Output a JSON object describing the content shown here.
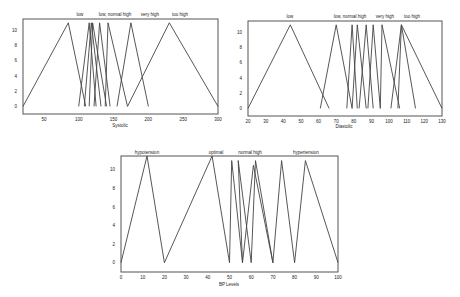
{
  "chart_data": [
    {
      "type": "line",
      "title": "",
      "xlabel": "Systolic",
      "ylabel": "",
      "xlim": [
        20,
        300
      ],
      "ylim": [
        -1,
        11.5
      ],
      "xticks": [
        50,
        100,
        150,
        200,
        250,
        300
      ],
      "yticks": [
        0,
        2,
        4,
        6,
        8,
        10
      ],
      "grid": false,
      "annotations": [
        "low",
        "low, normal high",
        "very high",
        "too high"
      ],
      "series": [
        {
          "name": "low",
          "x": [
            20,
            85,
            110
          ],
          "y": [
            0,
            11,
            0
          ]
        },
        {
          "name": "low_2",
          "x": [
            100,
            115,
            125
          ],
          "y": [
            0,
            11,
            0
          ]
        },
        {
          "name": "normal",
          "x": [
            108,
            118,
            132
          ],
          "y": [
            0,
            11,
            0
          ]
        },
        {
          "name": "normal_2",
          "x": [
            115,
            120,
            140
          ],
          "y": [
            0,
            11,
            0
          ]
        },
        {
          "name": "high",
          "x": [
            122,
            130,
            145
          ],
          "y": [
            0,
            11,
            0
          ]
        },
        {
          "name": "high_2",
          "x": [
            138,
            142,
            170
          ],
          "y": [
            0,
            11,
            0
          ]
        },
        {
          "name": "very high",
          "x": [
            155,
            175,
            200
          ],
          "y": [
            0,
            11,
            0
          ]
        },
        {
          "name": "too high",
          "x": [
            170,
            230,
            300
          ],
          "y": [
            0,
            11,
            0
          ]
        }
      ]
    },
    {
      "type": "line",
      "title": "",
      "xlabel": "Diastolic",
      "ylabel": "",
      "xlim": [
        20,
        130
      ],
      "ylim": [
        -1,
        11.5
      ],
      "xticks": [
        20,
        30,
        40,
        50,
        60,
        70,
        80,
        90,
        100,
        110,
        120,
        130
      ],
      "yticks": [
        0,
        2,
        4,
        6,
        8,
        10
      ],
      "grid": false,
      "annotations": [
        "low",
        "low, normal high",
        "very high",
        "too high"
      ],
      "series": [
        {
          "name": "low",
          "x": [
            20,
            44,
            66
          ],
          "y": [
            0,
            11,
            0
          ]
        },
        {
          "name": "low_2",
          "x": [
            61,
            70,
            79
          ],
          "y": [
            0,
            11,
            0
          ]
        },
        {
          "name": "normal",
          "x": [
            76,
            79,
            82
          ],
          "y": [
            0,
            11,
            0
          ]
        },
        {
          "name": "normal_2",
          "x": [
            79,
            82,
            87
          ],
          "y": [
            0,
            11,
            0
          ]
        },
        {
          "name": "high",
          "x": [
            83,
            87,
            91
          ],
          "y": [
            0,
            11,
            0
          ]
        },
        {
          "name": "high_2",
          "x": [
            88,
            91,
            95
          ],
          "y": [
            0,
            11,
            0
          ]
        },
        {
          "name": "very high",
          "x": [
            95,
            96,
            106
          ],
          "y": [
            0,
            11,
            0
          ]
        },
        {
          "name": "too high",
          "x": [
            105,
            107,
            130
          ],
          "y": [
            0,
            11,
            0
          ]
        },
        {
          "name": "too high_2",
          "x": [
            101,
            107,
            115
          ],
          "y": [
            0,
            11,
            0
          ]
        }
      ]
    },
    {
      "type": "line",
      "title": "",
      "xlabel": "BP Levels",
      "ylabel": "",
      "xlim": [
        0,
        100
      ],
      "ylim": [
        -1,
        11.5
      ],
      "xticks": [
        0,
        10,
        20,
        30,
        40,
        50,
        60,
        70,
        80,
        90,
        100
      ],
      "yticks": [
        0,
        2,
        4,
        6,
        8,
        10
      ],
      "grid": false,
      "annotations": [
        "hypotension",
        "optimal",
        "normal high",
        "hypertension"
      ],
      "series": [
        {
          "name": "hypotension",
          "x": [
            0,
            12,
            20
          ],
          "y": [
            0,
            11.5,
            0
          ]
        },
        {
          "name": "optimal",
          "x": [
            20,
            42,
            50
          ],
          "y": [
            0,
            11.5,
            0
          ]
        },
        {
          "name": "normal",
          "x": [
            50,
            51,
            56
          ],
          "y": [
            0,
            11,
            0
          ]
        },
        {
          "name": "normal_2",
          "x": [
            56,
            54,
            60
          ],
          "y": [
            0,
            11,
            0
          ]
        },
        {
          "name": "normal high",
          "x": [
            56,
            61,
            70
          ],
          "y": [
            0,
            10.5,
            0
          ]
        },
        {
          "name": "normal high_2",
          "x": [
            60,
            62,
            70
          ],
          "y": [
            0,
            11,
            0
          ]
        },
        {
          "name": "hypertension",
          "x": [
            70,
            74,
            80
          ],
          "y": [
            0,
            11,
            0
          ]
        },
        {
          "name": "hypertension_2",
          "x": [
            80,
            85,
            100
          ],
          "y": [
            0,
            11,
            0
          ]
        }
      ]
    }
  ],
  "charts": {
    "systolic": {
      "xlabel": "Systolic",
      "xticks": [
        "50",
        "100",
        "150",
        "200",
        "250",
        "300"
      ],
      "yticks": [
        "0",
        "2",
        "4",
        "6",
        "8",
        "10"
      ],
      "labels": [
        "low",
        "low, normal high",
        "very high",
        "too high"
      ]
    },
    "diastolic": {
      "xlabel": "Diastolic",
      "xticks": [
        "20",
        "30",
        "40",
        "50",
        "60",
        "70",
        "80",
        "90",
        "100",
        "110",
        "120",
        "130"
      ],
      "yticks": [
        "0",
        "2",
        "4",
        "6",
        "8",
        "10"
      ],
      "labels": [
        "low",
        "low, normal high",
        "very high",
        "too high"
      ]
    },
    "bp": {
      "xlabel": "BP Levels",
      "xticks": [
        "0",
        "10",
        "20",
        "30",
        "40",
        "50",
        "60",
        "70",
        "80",
        "90",
        "100"
      ],
      "yticks": [
        "0",
        "2",
        "4",
        "6",
        "8",
        "10"
      ],
      "labels": [
        "hypotension",
        "optimal",
        "normal high",
        "hypertension"
      ]
    }
  }
}
